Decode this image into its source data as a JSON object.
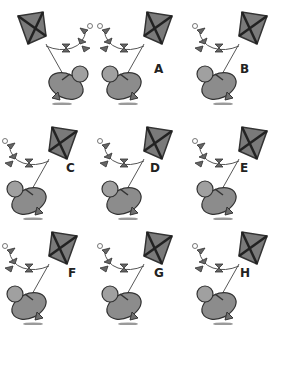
{
  "puzzle": {
    "reference": {
      "label": ""
    },
    "options": [
      {
        "label": "A"
      },
      {
        "label": "B"
      },
      {
        "label": "C"
      },
      {
        "label": "D"
      },
      {
        "label": "E"
      },
      {
        "label": "F"
      },
      {
        "label": "G"
      },
      {
        "label": "H"
      }
    ]
  },
  "colors": {
    "kite": "#7a7a7a",
    "outline": "#333333",
    "figure": "#8c8c8c",
    "shadow": "#9a9a9a"
  }
}
